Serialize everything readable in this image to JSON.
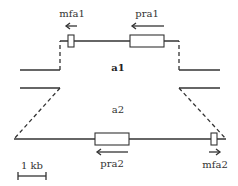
{
  "diagram": {
    "type": "mating-type locus schematic",
    "alleles": [
      {
        "id": "a1",
        "label": "a1",
        "genes": [
          {
            "name": "mfa1",
            "direction": "left"
          },
          {
            "name": "pra1",
            "direction": "left"
          }
        ]
      },
      {
        "id": "a2",
        "label": "a2",
        "genes": [
          {
            "name": "pra2",
            "direction": "left"
          },
          {
            "name": "mfa2",
            "direction": "right"
          }
        ]
      }
    ],
    "scale_bar": {
      "label": "1 kb"
    }
  },
  "labels": {
    "mfa1": "mfa1",
    "pra1": "pra1",
    "a1": "a1",
    "a2": "a2",
    "pra2": "pra2",
    "mfa2": "mfa2",
    "scale": "1 kb"
  },
  "colors": {
    "line": "#333333",
    "background": "#ffffff"
  }
}
